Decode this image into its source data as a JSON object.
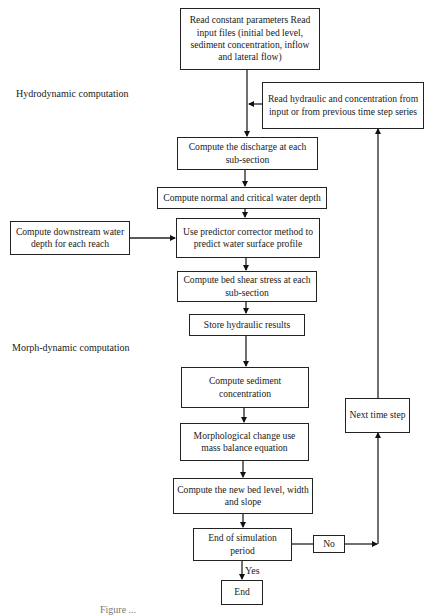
{
  "sections": {
    "hydrodynamic": "Hydrodynamic computation",
    "morphdynamic": "Morph-dynamic computation"
  },
  "nodes": {
    "read_input": "Read constant parameters Read input files (initial bed level, sediment concentration, inflow and lateral flow)",
    "read_hydraulic": "Read hydraulic and concentration from input or from previous time step series",
    "discharge": "Compute the discharge at each sub-section",
    "normal_critical": "Compute normal and critical water depth",
    "downstream": "Compute downstream water depth for each reach",
    "predictor": "Use predictor corrector method to predict water surface profile",
    "bed_shear": "Compute bed shear stress at each sub-section",
    "store": "Store hydraulic results",
    "sediment": "Compute sediment concentration",
    "morphological": "Morphological change use mass balance equation",
    "new_bed": "Compute the new bed level, width and slope",
    "end_check": "End of simulation period",
    "no": "No",
    "next_step": "Next time step",
    "end": "End"
  },
  "edge_labels": {
    "yes": "Yes"
  },
  "caption": "Figure ..."
}
